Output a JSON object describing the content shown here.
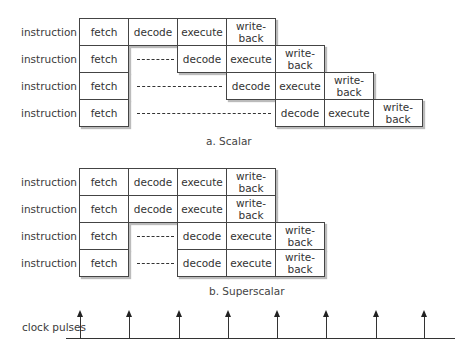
{
  "scalar": {
    "caption": "a. Scalar",
    "rows": [
      {
        "label": "instruction 1",
        "fetch": "fetch",
        "decode": "decode",
        "execute": "execute",
        "writeback": "write-\nback"
      },
      {
        "label": "instruction 2",
        "fetch": "fetch",
        "decode": "decode",
        "execute": "execute",
        "writeback": "write-\nback"
      },
      {
        "label": "instruction 3",
        "fetch": "fetch",
        "decode": "decode",
        "execute": "execute",
        "writeback": "write-\nback"
      },
      {
        "label": "instruction 4",
        "fetch": "fetch",
        "decode": "decode",
        "execute": "execute",
        "writeback": "write-\nback"
      }
    ]
  },
  "superscalar": {
    "caption": "b. Superscalar",
    "rows": [
      {
        "label": "instruction 1",
        "fetch": "fetch",
        "decode": "decode",
        "execute": "execute",
        "writeback": "write-\nback"
      },
      {
        "label": "instruction 2",
        "fetch": "fetch",
        "decode": "decode",
        "execute": "execute",
        "writeback": "write-\nback"
      },
      {
        "label": "instruction 3",
        "fetch": "fetch",
        "decode": "decode",
        "execute": "execute",
        "writeback": "write-\nback"
      },
      {
        "label": "instruction 4",
        "fetch": "fetch",
        "decode": "decode",
        "execute": "execute",
        "writeback": "write-\nback"
      }
    ]
  },
  "clock": {
    "label": "clock pulses",
    "pulse_count": 8
  }
}
